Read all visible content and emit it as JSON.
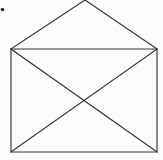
{
  "image": {
    "title": "Envelope line drawing",
    "description": "Simple black-and-white line drawing of a closed envelope seen from the back, with a large triangular flap at the top and two crossing diagonal fold lines forming an X on the body.",
    "background_color": "#fdfdfc",
    "line_color": "#3a3a3a",
    "line_width": 1.2,
    "width": 163,
    "height": 160
  },
  "figure": {
    "name": "envelope",
    "body": {
      "name": "envelope-body-rectangle",
      "left": 11,
      "top": 49,
      "right": 157,
      "bottom": 152,
      "width": 146,
      "height": 103
    },
    "flap": {
      "name": "envelope-flap-triangle",
      "apex_x": 85,
      "apex_y": 0,
      "left_x": 11,
      "left_y": 49,
      "right_x": 157,
      "right_y": 49,
      "note": "apex is clipped by the top edge of the image"
    },
    "fold_lines": {
      "name": "envelope-cross-fold-lines",
      "diagonal_1": {
        "x1": 11,
        "y1": 49,
        "x2": 157,
        "y2": 152
      },
      "diagonal_2": {
        "x1": 157,
        "y1": 49,
        "x2": 11,
        "y2": 152
      },
      "intersection_x": 84,
      "intersection_y": 100
    },
    "speck": {
      "name": "ink-speck-artifact",
      "x": 2.5,
      "y": 9.5,
      "radius": 1.8
    }
  }
}
